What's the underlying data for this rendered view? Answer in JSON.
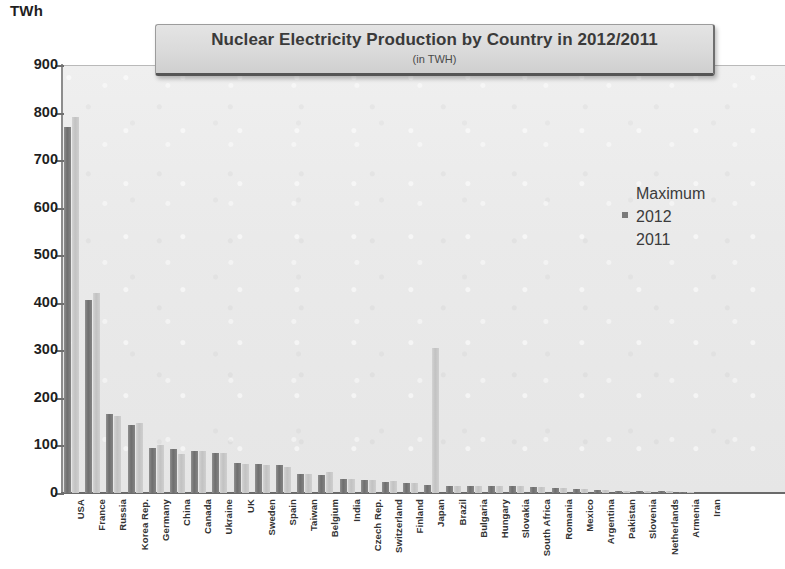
{
  "header": {
    "y_unit_label": "TWh"
  },
  "title_box": {
    "title": "Nuclear Electricity Production by Country in 2012/2011",
    "subtitle": "(in TWH)"
  },
  "legend": {
    "title": "Maximum",
    "items": [
      {
        "label": "2012",
        "color": "#7a7a7a",
        "has_marker": true
      },
      {
        "label": "2011",
        "color": "#c9c9c9",
        "has_marker": false
      }
    ]
  },
  "chart_data": {
    "type": "bar",
    "title": "Nuclear Electricity Production by Country in 2012/2011",
    "subtitle": "(in TWH)",
    "xlabel": "",
    "ylabel": "TWh",
    "ylim": [
      0,
      900
    ],
    "yticks": [
      0,
      100,
      200,
      300,
      400,
      500,
      600,
      700,
      800,
      900
    ],
    "grid": false,
    "legend_position": "center-right",
    "legend_title": "Maximum",
    "categories": [
      "USA",
      "France",
      "Russia",
      "Korea Rep.",
      "Germany",
      "China",
      "Canada",
      "Ukraine",
      "UK",
      "Sweden",
      "Spain",
      "Taiwan",
      "Belgium",
      "India",
      "Czech Rep.",
      "Switzerland",
      "Finland",
      "Japan",
      "Brazil",
      "Bulgaria",
      "Hungary",
      "Slovakia",
      "South Africa",
      "Romania",
      "Mexico",
      "Argentina",
      "Pakistan",
      "Slovenia",
      "Netherlands",
      "Armenia",
      "Iran"
    ],
    "series": [
      {
        "name": "2012",
        "color": "#6e6e6e",
        "values": [
          770,
          405,
          166,
          143,
          94,
          92,
          89,
          85,
          64,
          61,
          58,
          39,
          38,
          30,
          28,
          24,
          22,
          17,
          15,
          15,
          14,
          14,
          12,
          11,
          8,
          6,
          5,
          5,
          4,
          2,
          1
        ]
      },
      {
        "name": "2011",
        "color": "#c9c9c9",
        "values": [
          790,
          421,
          162,
          147,
          102,
          82,
          88,
          85,
          62,
          58,
          55,
          41,
          45,
          29,
          27,
          25,
          22,
          305,
          15,
          15,
          14,
          14,
          13,
          11,
          9,
          6,
          4,
          5,
          4,
          2,
          0
        ]
      }
    ]
  }
}
